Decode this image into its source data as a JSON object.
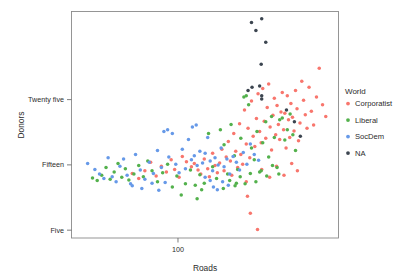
{
  "chart_data": {
    "type": "scatter",
    "title": "",
    "xlabel": "Roads",
    "ylabel": "Donors",
    "x_scale": "log",
    "xticks": [
      {
        "value": 100,
        "label": "100"
      }
    ],
    "yticks": [
      {
        "value": 25,
        "label": "Twenty five"
      },
      {
        "value": 15,
        "label": "Fifteen"
      },
      {
        "value": 5,
        "label": "Five"
      }
    ],
    "xlim": [
      38,
      430
    ],
    "ylim": [
      3.8,
      38.5
    ],
    "grid": false,
    "legend": {
      "title": "World",
      "position": "right",
      "entries": [
        {
          "label": "Corporatist",
          "color": "#F8766D"
        },
        {
          "label": "Liberal",
          "color": "#53B14C"
        },
        {
          "label": "SocDem",
          "color": "#6699E8"
        },
        {
          "label": "NA",
          "color": "#3C4550"
        }
      ]
    },
    "series": [
      {
        "name": "Corporatist",
        "color": "#F8766D",
        "points": [
          [
            104,
            16.3
          ],
          [
            108,
            15.5
          ],
          [
            113,
            14.7
          ],
          [
            116,
            15.2
          ],
          [
            120,
            14.2
          ],
          [
            123,
            13.6
          ],
          [
            127,
            15.9
          ],
          [
            131,
            14.4
          ],
          [
            133,
            13.2
          ],
          [
            137,
            16.8
          ],
          [
            140,
            14.9
          ],
          [
            143,
            13.8
          ],
          [
            146,
            15.3
          ],
          [
            149,
            17.4
          ],
          [
            152,
            14.1
          ],
          [
            155,
            16.2
          ],
          [
            158,
            18.6
          ],
          [
            161,
            15.6
          ],
          [
            163,
            13.4
          ],
          [
            166,
            19.8
          ],
          [
            169,
            17.1
          ],
          [
            172,
            14.6
          ],
          [
            175,
            21.3
          ],
          [
            177,
            16.6
          ],
          [
            180,
            15.1
          ],
          [
            183,
            23.4
          ],
          [
            186,
            18.2
          ],
          [
            189,
            20.6
          ],
          [
            192,
            16.1
          ],
          [
            195,
            24.8
          ],
          [
            198,
            19.4
          ],
          [
            201,
            17.8
          ],
          [
            204,
            22.1
          ],
          [
            207,
            25.9
          ],
          [
            210,
            20.1
          ],
          [
            213,
            18.4
          ],
          [
            216,
            26.7
          ],
          [
            219,
            21.7
          ],
          [
            222,
            19.1
          ],
          [
            225,
            23.8
          ],
          [
            228,
            27.4
          ],
          [
            231,
            20.8
          ],
          [
            234,
            17.3
          ],
          [
            237,
            22.6
          ],
          [
            240,
            25.2
          ],
          [
            243,
            19.6
          ],
          [
            246,
            24.1
          ],
          [
            249,
            21.2
          ],
          [
            252,
            18.9
          ],
          [
            255,
            23.1
          ],
          [
            258,
            26.1
          ],
          [
            261,
            20.4
          ],
          [
            264,
            22.9
          ],
          [
            267,
            17.6
          ],
          [
            270,
            25.6
          ],
          [
            273,
            21.9
          ],
          [
            276,
            19.2
          ],
          [
            279,
            24.4
          ],
          [
            283,
            22.3
          ],
          [
            287,
            20.2
          ],
          [
            291,
            26.4
          ],
          [
            295,
            23.6
          ],
          [
            299,
            18.7
          ],
          [
            303,
            21.4
          ],
          [
            308,
            27.8
          ],
          [
            313,
            24.9
          ],
          [
            318,
            22.7
          ],
          [
            323,
            20.6
          ],
          [
            329,
            26.9
          ],
          [
            336,
            23.2
          ],
          [
            343,
            21.1
          ],
          [
            352,
            25.4
          ],
          [
            361,
            29.8
          ],
          [
            372,
            24.2
          ],
          [
            383,
            22.4
          ],
          [
            101,
            13.1
          ],
          [
            97,
            14.3
          ],
          [
            94,
            15.8
          ],
          [
            90,
            13.9
          ],
          [
            86,
            14.8
          ],
          [
            82,
            13.3
          ],
          [
            78,
            15.4
          ],
          [
            74,
            14.1
          ],
          [
            70,
            12.9
          ],
          [
            66,
            13.7
          ],
          [
            188,
            10.2
          ],
          [
            193,
            7.6
          ],
          [
            206,
            5.1
          ],
          [
            186,
            12.4
          ],
          [
            214,
            14.3
          ],
          [
            230,
            13.1
          ],
          [
            245,
            14.8
          ],
          [
            262,
            13.4
          ],
          [
            281,
            15.2
          ],
          [
            296,
            14.1
          ]
        ]
      },
      {
        "name": "Liberal",
        "color": "#53B14C",
        "points": [
          [
            46,
            13.0
          ],
          [
            48,
            12.6
          ],
          [
            50,
            13.4
          ],
          [
            52,
            14.6
          ],
          [
            54,
            12.8
          ],
          [
            56,
            13.9
          ],
          [
            58,
            15.2
          ],
          [
            60,
            13.1
          ],
          [
            62,
            14.4
          ],
          [
            64,
            12.7
          ],
          [
            67,
            13.6
          ],
          [
            70,
            14.9
          ],
          [
            73,
            13.2
          ],
          [
            76,
            15.6
          ],
          [
            79,
            14.1
          ],
          [
            83,
            12.4
          ],
          [
            87,
            13.8
          ],
          [
            91,
            15.1
          ],
          [
            95,
            11.6
          ],
          [
            99,
            13.3
          ],
          [
            103,
            10.4
          ],
          [
            107,
            12.1
          ],
          [
            112,
            14.2
          ],
          [
            117,
            11.9
          ],
          [
            122,
            13.5
          ],
          [
            127,
            12.2
          ],
          [
            132,
            19.8
          ],
          [
            137,
            14.7
          ],
          [
            142,
            12.9
          ],
          [
            147,
            20.4
          ],
          [
            152,
            18.1
          ],
          [
            157,
            13.6
          ],
          [
            162,
            21.2
          ],
          [
            167,
            16.4
          ],
          [
            172,
            14.3
          ],
          [
            177,
            19.1
          ],
          [
            182,
            25.4
          ],
          [
            186,
            25.6
          ],
          [
            190,
            24.2
          ],
          [
            195,
            17.6
          ],
          [
            200,
            15.8
          ],
          [
            205,
            20.1
          ],
          [
            210,
            13.9
          ],
          [
            216,
            18.4
          ],
          [
            222,
            21.6
          ],
          [
            228,
            16.2
          ],
          [
            234,
            22.4
          ],
          [
            240,
            19.2
          ],
          [
            246,
            14.6
          ],
          [
            252,
            21.9
          ],
          [
            258,
            22.2
          ],
          [
            264,
            18.8
          ],
          [
            270,
            20.4
          ],
          [
            277,
            22.8
          ],
          [
            284,
            19.6
          ],
          [
            291,
            17.2
          ],
          [
            119,
            9.8
          ],
          [
            124,
            11.2
          ],
          [
            151,
            11.4
          ],
          [
            160,
            12.6
          ],
          [
            168,
            11.8
          ],
          [
            176,
            13.2
          ],
          [
            184,
            12.1
          ],
          [
            193,
            13.7
          ],
          [
            203,
            12.4
          ],
          [
            213,
            14.1
          ],
          [
            224,
            13.3
          ],
          [
            236,
            14.9
          ],
          [
            250,
            13.6
          ],
          [
            170,
            12.2
          ]
        ]
      },
      {
        "name": "SocDem",
        "color": "#6699E8",
        "points": [
          [
            44,
            15.2
          ],
          [
            47,
            14.3
          ],
          [
            49,
            13.6
          ],
          [
            51,
            12.9
          ],
          [
            53,
            16.1
          ],
          [
            55,
            13.2
          ],
          [
            57,
            12.4
          ],
          [
            59,
            14.8
          ],
          [
            61,
            15.9
          ],
          [
            63,
            13.4
          ],
          [
            65,
            12.1
          ],
          [
            68,
            16.6
          ],
          [
            71,
            14.2
          ],
          [
            74,
            12.8
          ],
          [
            77,
            15.4
          ],
          [
            80,
            13.7
          ],
          [
            83,
            17.2
          ],
          [
            86,
            14.6
          ],
          [
            89,
            12.3
          ],
          [
            92,
            16.2
          ],
          [
            95,
            19.8
          ],
          [
            98,
            15.1
          ],
          [
            101,
            13.8
          ],
          [
            104,
            17.4
          ],
          [
            107,
            14.4
          ],
          [
            110,
            18.9
          ],
          [
            113,
            15.8
          ],
          [
            116,
            16.4
          ],
          [
            119,
            14.9
          ],
          [
            122,
            17.1
          ],
          [
            125,
            15.3
          ],
          [
            128,
            16.8
          ],
          [
            131,
            19.2
          ],
          [
            134,
            15.6
          ],
          [
            137,
            14.1
          ],
          [
            140,
            16.1
          ],
          [
            144,
            15.0
          ],
          [
            148,
            17.6
          ],
          [
            152,
            14.7
          ],
          [
            156,
            15.9
          ],
          [
            160,
            13.6
          ],
          [
            165,
            16.3
          ],
          [
            170,
            15.4
          ],
          [
            175,
            14.2
          ],
          [
            181,
            16.9
          ],
          [
            187,
            15.1
          ],
          [
            193,
            18.2
          ],
          [
            200,
            16.6
          ],
          [
            208,
            15.7
          ],
          [
            88,
            20.1
          ],
          [
            91,
            20.4
          ],
          [
            114,
            20.8
          ],
          [
            118,
            21.1
          ],
          [
            138,
            11.6
          ],
          [
            143,
            11.2
          ],
          [
            66,
            11.8
          ],
          [
            72,
            11.4
          ],
          [
            79,
            12.2
          ],
          [
            84,
            11.1
          ],
          [
            150,
            12.4
          ],
          [
            158,
            11.9
          ],
          [
            134,
            12.6
          ],
          [
            128,
            13.1
          ]
        ]
      },
      {
        "name": "NA",
        "color": "#3C4550",
        "points": [
          [
            195,
            36.8
          ],
          [
            214,
            37.4
          ],
          [
            203,
            35.6
          ],
          [
            222,
            33.8
          ],
          [
            213,
            30.4
          ],
          [
            196,
            26.9
          ],
          [
            210,
            27.1
          ],
          [
            214,
            25.6
          ],
          [
            214,
            25.1
          ],
          [
            268,
            23.4
          ],
          [
            288,
            21.6
          ],
          [
            304,
            19.4
          ],
          [
            189,
            26.4
          ]
        ]
      }
    ]
  }
}
